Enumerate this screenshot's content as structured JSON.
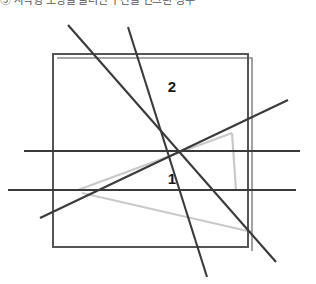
{
  "caption": {
    "text": "⑤ 사각형 모양을 둘러싼 구간을 연그린 정부"
  },
  "figure": {
    "labels": [
      {
        "name": "region-2",
        "text": "2",
        "x": 172,
        "y": 86
      },
      {
        "name": "region-1",
        "text": "1",
        "x": 172,
        "y": 178
      }
    ],
    "colors": {
      "outline": "#555555",
      "outline_secondary": "#6b6b6b",
      "line": "#3a3a3a",
      "guide": "#c9c9c9",
      "background": "#ffffff"
    },
    "square": {
      "left": 53,
      "top": 54,
      "right": 248,
      "bottom": 247,
      "offset_duplicate": 4
    },
    "guide_triangle": {
      "apex_x": 78,
      "apex_y": 190,
      "upper_right_x": 232,
      "upper_right_y": 133,
      "lower_right_x": 232,
      "lower_right_y": 190
    },
    "lines": [
      {
        "name": "diagonal-main",
        "x1": 68,
        "y1": 25,
        "x2": 276,
        "y2": 262
      },
      {
        "name": "diagonal-steep",
        "x1": 128,
        "y1": 27,
        "x2": 207,
        "y2": 277
      },
      {
        "name": "diagonal-rising",
        "x1": 40,
        "y1": 218,
        "x2": 288,
        "y2": 100
      },
      {
        "name": "horizontal-upper",
        "x1": 24,
        "y1": 151,
        "x2": 300,
        "y2": 151
      },
      {
        "name": "horizontal-lower",
        "x1": 8,
        "y1": 190,
        "x2": 296,
        "y2": 190
      }
    ]
  }
}
